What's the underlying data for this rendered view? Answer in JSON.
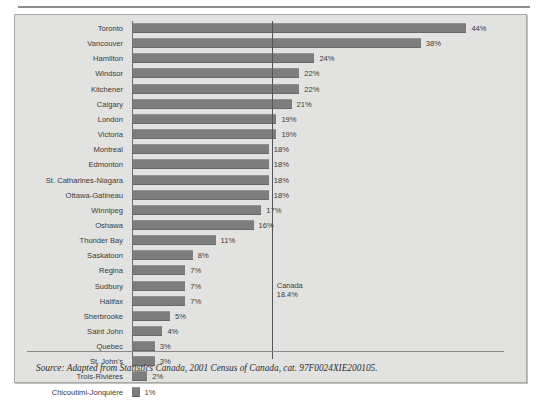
{
  "figure": {
    "source_note": "Source: Adapted from Statistics Canada, 2001 Census of Canada, cat. 97F0024XIE200105.",
    "bar_color": "#7d7d7d",
    "panel_color": "#e2e2e0"
  },
  "chart_data": {
    "type": "bar",
    "orientation": "horizontal",
    "title": "",
    "xlabel": "",
    "ylabel": "",
    "xlim": [
      0,
      48
    ],
    "grid": false,
    "legend": false,
    "value_suffix": "%",
    "categories": [
      "Toronto",
      "Vancouver",
      "Hamilton",
      "Windsor",
      "Kitchener",
      "Calgary",
      "London",
      "Victoria",
      "Montreal",
      "Edmonton",
      "St. Catharines-Niagara",
      "Ottawa-Gatineau",
      "Winnipeg",
      "Oshawa",
      "Thunder Bay",
      "Saskatoon",
      "Regina",
      "Sudbury",
      "Halifax",
      "Sherbrooke",
      "Saint John",
      "Quebec",
      "St. John's",
      "Trois-Rivières",
      "Chicoutimi-Jonquière"
    ],
    "values": [
      44,
      38,
      24,
      22,
      22,
      21,
      19,
      19,
      18,
      18,
      18,
      18,
      17,
      16,
      11,
      8,
      7,
      7,
      7,
      5,
      4,
      3,
      3,
      2,
      1
    ],
    "labels": [
      "44%",
      "38%",
      "24%",
      "22%",
      "22%",
      "21%",
      "19%",
      "19%",
      "18%",
      "18%",
      "18%",
      "18%",
      "17%",
      "16%",
      "11%",
      "8%",
      "7%",
      "7%",
      "7%",
      "5%",
      "4%",
      "3%",
      "3%",
      "2%",
      "1%"
    ],
    "reference_line": {
      "name": "Canada",
      "value": 18.4,
      "label_line1": "Canada",
      "label_line2": "18.4%"
    }
  }
}
